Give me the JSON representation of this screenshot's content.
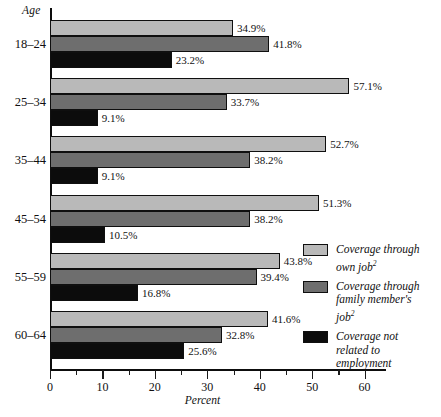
{
  "chart_data": {
    "type": "bar",
    "orientation": "horizontal",
    "title": "",
    "xlabel": "Percent",
    "ylabel": "Age",
    "xlim": [
      0,
      64
    ],
    "xticks_major": [
      0,
      10,
      20,
      30,
      40,
      50,
      60
    ],
    "xticks_minor": [
      5,
      15,
      25,
      35,
      45,
      55
    ],
    "xtick_labels": [
      "0",
      "10",
      "20",
      "30",
      "40",
      "50",
      "60"
    ],
    "grid": false,
    "legend_position": "right",
    "categories": [
      "18–24",
      "25–34",
      "35–44",
      "45–54",
      "55–59",
      "60–64"
    ],
    "series": [
      {
        "name": "Coverage through own job",
        "key": "own",
        "color": "#b9b9b9",
        "values": [
          34.9,
          57.1,
          52.7,
          51.3,
          43.8,
          41.6
        ],
        "labels": [
          "34.9%",
          "57.1%",
          "52.7%",
          "51.3%",
          "43.8%",
          "41.6%"
        ]
      },
      {
        "name": "Coverage through family member's job",
        "key": "family",
        "color": "#6e6e6e",
        "values": [
          41.8,
          33.7,
          38.2,
          38.2,
          39.4,
          32.8
        ],
        "labels": [
          "41.8%",
          "33.7%",
          "38.2%",
          "38.2%",
          "39.4%",
          "32.8%"
        ]
      },
      {
        "name": "Coverage not related to employment",
        "key": "notrel",
        "color": "#0c0c0c",
        "values": [
          23.2,
          9.1,
          9.1,
          10.5,
          16.8,
          25.6
        ],
        "labels": [
          "23.2%",
          "9.1%",
          "9.1%",
          "10.5%",
          "16.8%",
          "25.6%"
        ]
      }
    ]
  },
  "axes": {
    "y_title": "Age",
    "x_title": "Percent"
  },
  "legend": {
    "items": [
      {
        "swatch": "own",
        "line1": "Coverage through",
        "line2": "own job",
        "sup": "2",
        "line3": ""
      },
      {
        "swatch": "family",
        "line1": "Coverage through",
        "line2": "family member's",
        "sup": "2",
        "line3": "job"
      },
      {
        "swatch": "notrel",
        "line1": "Coverage not",
        "line2": "related to",
        "sup": "",
        "line3": "employment"
      }
    ]
  }
}
